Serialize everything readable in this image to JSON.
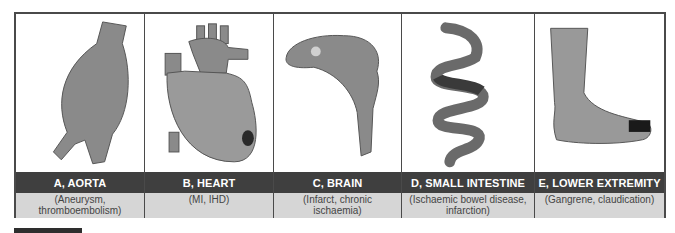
{
  "panels": [
    {
      "id": "A",
      "title": "A, AORTA",
      "subtitle": "(Aneurysm,\nthromboembolism)",
      "image": "aorta-aneurysm"
    },
    {
      "id": "B",
      "title": "B, HEART",
      "subtitle": "(MI, IHD)",
      "image": "heart-infarct"
    },
    {
      "id": "C",
      "title": "C, BRAIN",
      "subtitle": "(Infarct, chronic\nischaemia)",
      "image": "brain-infarct"
    },
    {
      "id": "D",
      "title": "D, SMALL INTESTINE",
      "subtitle": "(Ischaemic bowel disease,\ninfarction)",
      "image": "small-intestine"
    },
    {
      "id": "E",
      "title": "E, LOWER EXTREMITY",
      "subtitle": "(Gangrene, claudication)",
      "image": "foot-gangrene"
    }
  ],
  "colors": {
    "frame": "#4a4a4a",
    "title_bg": "#3f3f3f",
    "subtitle_bg": "#d6d6d6",
    "organ": "#8a8a8a",
    "lesion": "#2a2a2a"
  }
}
